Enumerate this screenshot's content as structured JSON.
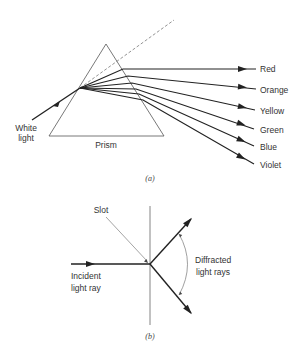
{
  "figure_a": {
    "caption": "(a)",
    "input_label_line1": "White",
    "input_label_line2": "light",
    "prism_label": "Prism",
    "colors": [
      {
        "label": "Red"
      },
      {
        "label": "Orange"
      },
      {
        "label": "Yellow"
      },
      {
        "label": "Green"
      },
      {
        "label": "Blue"
      },
      {
        "label": "Violet"
      }
    ]
  },
  "figure_b": {
    "caption": "(b)",
    "slot_label": "Slot",
    "incident_label_line1": "Incident",
    "incident_label_line2": "light ray",
    "diffracted_label_line1": "Diffracted",
    "diffracted_label_line2": "light rays"
  },
  "style": {
    "ray_color": "#222222",
    "outline_color": "#555555"
  }
}
